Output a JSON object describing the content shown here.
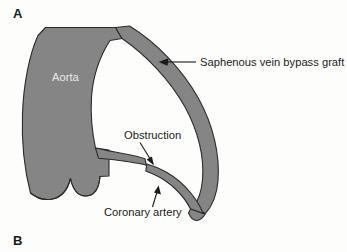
{
  "figure": {
    "panels": [
      {
        "letter": "A"
      },
      {
        "letter": "B"
      }
    ],
    "background_color": "#fdfdfc",
    "vessel_fill_color": "#858585",
    "vessel_outline_color": "#2b2b2b",
    "text_color": "#1b1b1b",
    "inner_label_color": "#e9e9e9"
  },
  "labels": {
    "aorta": "Aorta",
    "graft": "Saphenous vein bypass graft",
    "obstruction": "Obstruction",
    "coronary_artery": "Coronary artery"
  },
  "diagram": {
    "type": "anatomical-illustration",
    "structures": [
      {
        "name": "aorta",
        "label": "Aorta",
        "label_style": "white-text-on-vessel",
        "label_position": {
          "x": 52,
          "y": 81
        }
      },
      {
        "name": "saphenous-vein-bypass-graft",
        "label": "Saphenous vein bypass graft",
        "label_style": "callout-right",
        "label_position": {
          "x": 200,
          "y": 66
        },
        "arrow_from": {
          "x": 196,
          "y": 62
        },
        "arrow_to": {
          "x": 160,
          "y": 62
        }
      },
      {
        "name": "obstruction",
        "label": "Obstruction",
        "label_style": "callout-above",
        "label_position": {
          "x": 124,
          "y": 139
        },
        "arrow_from": {
          "x": 141,
          "y": 143
        },
        "arrow_to": {
          "x": 152,
          "y": 163
        }
      },
      {
        "name": "coronary-artery",
        "label": "Coronary artery",
        "label_style": "callout-below",
        "label_position": {
          "x": 104,
          "y": 216
        },
        "arrow_from": {
          "x": 152,
          "y": 207
        },
        "arrow_to": {
          "x": 157,
          "y": 187
        }
      },
      {
        "name": "aortic-valve-cusps",
        "label": "",
        "label_style": "unlabeled"
      }
    ]
  }
}
